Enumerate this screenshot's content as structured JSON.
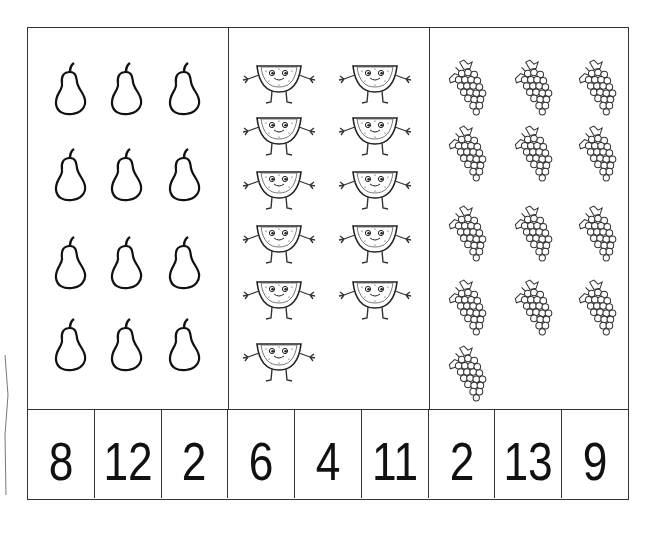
{
  "worksheet": {
    "panels": [
      {
        "fruit": "pear",
        "icon": "pear-icon",
        "count": 12,
        "layout_cols": 3
      },
      {
        "fruit": "watermelon",
        "icon": "watermelon-character-icon",
        "count": 11,
        "layout_cols": 2
      },
      {
        "fruit": "grapes",
        "icon": "grapes-icon",
        "count": 13,
        "layout_cols": 3
      }
    ],
    "number_cells": [
      "8",
      "12",
      "2",
      "6",
      "4",
      "11",
      "2",
      "13",
      "9"
    ],
    "colors": {
      "ink": "#111111",
      "border": "#333333",
      "paper": "#ffffff"
    }
  }
}
